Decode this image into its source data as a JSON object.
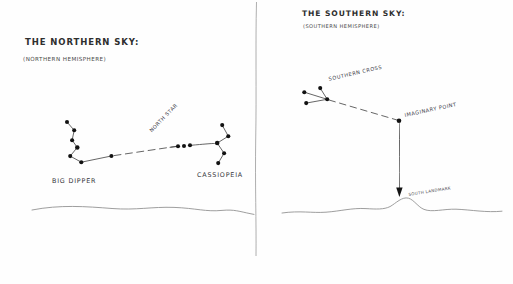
{
  "page": {
    "background_color": "#fefefe",
    "ink_color": "#2f2f2f",
    "star_color": "#141414",
    "line_color": "#6b6b6b"
  },
  "panels": {
    "northern": {
      "title": "THE NORTHERN SKY:",
      "subtitle": "(NORTHERN HEMISPHERE)",
      "labels": {
        "big_dipper": "BIG DIPPER",
        "north_star": "NORTH STAR",
        "cassiopeia": "CASSIOPEIA"
      },
      "big_dipper_stars": [
        {
          "x": 67,
          "y": 122
        },
        {
          "x": 74,
          "y": 130
        },
        {
          "x": 72,
          "y": 140
        },
        {
          "x": 77,
          "y": 147
        },
        {
          "x": 70,
          "y": 156
        },
        {
          "x": 81,
          "y": 162
        },
        {
          "x": 111,
          "y": 156
        }
      ],
      "north_star_cluster": [
        {
          "x": 178,
          "y": 146
        },
        {
          "x": 184,
          "y": 146
        },
        {
          "x": 190,
          "y": 145
        }
      ],
      "cassiopeia_stars": [
        {
          "x": 222,
          "y": 125
        },
        {
          "x": 228,
          "y": 136
        },
        {
          "x": 217,
          "y": 143
        },
        {
          "x": 224,
          "y": 153
        },
        {
          "x": 218,
          "y": 163
        }
      ]
    },
    "southern": {
      "title": "THE SOUTHERN SKY:",
      "subtitle": "(SOUTHERN HEMISPHERE)",
      "labels": {
        "southern_cross": "SOUTHERN CROSS",
        "imaginary_point": "IMAGINARY POINT",
        "south_landmark": "SOUTH LANDMARK"
      },
      "southern_cross_stars": [
        {
          "x": 304,
          "y": 92
        },
        {
          "x": 320,
          "y": 88
        },
        {
          "x": 306,
          "y": 103
        },
        {
          "x": 327,
          "y": 99
        }
      ],
      "imaginary_point": {
        "x": 399,
        "y": 121
      },
      "landmark_peak": {
        "x": 408,
        "y": 199
      }
    }
  },
  "divider": {
    "x": 256,
    "y_top": 2,
    "y_bottom": 256
  }
}
